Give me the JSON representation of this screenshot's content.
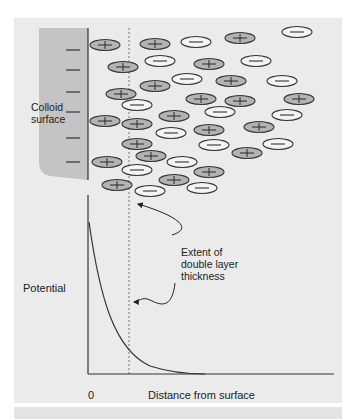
{
  "figure": {
    "colloid_label_line1": "Colloid",
    "colloid_label_line2": "surface",
    "annotation_line1": "Extent of",
    "annotation_line2": "double layer",
    "annotation_line3": "thickness",
    "y_axis_label": "Potential",
    "x_axis_origin": "0",
    "x_axis_label": "Distance from surface"
  },
  "colors": {
    "panel_bg": "#ebebeb",
    "colloid_fill": "#c4c4c4",
    "positive_ion_fill": "#b3b3b3",
    "negative_ion_fill": "#f4f4f4",
    "stroke": "#333333"
  },
  "ions": [
    {
      "x": 105,
      "y": 45,
      "sign": "+"
    },
    {
      "x": 155,
      "y": 44,
      "sign": "+"
    },
    {
      "x": 196,
      "y": 42,
      "sign": "-"
    },
    {
      "x": 240,
      "y": 38,
      "sign": "+"
    },
    {
      "x": 297,
      "y": 32,
      "sign": "-"
    },
    {
      "x": 123,
      "y": 67,
      "sign": "+"
    },
    {
      "x": 160,
      "y": 61,
      "sign": "-"
    },
    {
      "x": 209,
      "y": 64,
      "sign": "+"
    },
    {
      "x": 256,
      "y": 61,
      "sign": "-"
    },
    {
      "x": 155,
      "y": 86,
      "sign": "+"
    },
    {
      "x": 187,
      "y": 79,
      "sign": "-"
    },
    {
      "x": 231,
      "y": 81,
      "sign": "+"
    },
    {
      "x": 282,
      "y": 81,
      "sign": "-"
    },
    {
      "x": 121,
      "y": 94,
      "sign": "+"
    },
    {
      "x": 137,
      "y": 105,
      "sign": "-"
    },
    {
      "x": 201,
      "y": 99,
      "sign": "+"
    },
    {
      "x": 240,
      "y": 101,
      "sign": "+"
    },
    {
      "x": 299,
      "y": 99,
      "sign": "+"
    },
    {
      "x": 105,
      "y": 121,
      "sign": "+"
    },
    {
      "x": 137,
      "y": 124,
      "sign": "+"
    },
    {
      "x": 174,
      "y": 116,
      "sign": "+"
    },
    {
      "x": 220,
      "y": 112,
      "sign": "-"
    },
    {
      "x": 287,
      "y": 115,
      "sign": "-"
    },
    {
      "x": 171,
      "y": 133,
      "sign": "-"
    },
    {
      "x": 209,
      "y": 130,
      "sign": "+"
    },
    {
      "x": 259,
      "y": 127,
      "sign": "+"
    },
    {
      "x": 137,
      "y": 144,
      "sign": "+"
    },
    {
      "x": 214,
      "y": 145,
      "sign": "-"
    },
    {
      "x": 278,
      "y": 144,
      "sign": "-"
    },
    {
      "x": 107,
      "y": 162,
      "sign": "+"
    },
    {
      "x": 151,
      "y": 156,
      "sign": "+"
    },
    {
      "x": 182,
      "y": 162,
      "sign": "-"
    },
    {
      "x": 247,
      "y": 153,
      "sign": "+"
    },
    {
      "x": 137,
      "y": 170,
      "sign": "-"
    },
    {
      "x": 174,
      "y": 180,
      "sign": "+"
    },
    {
      "x": 209,
      "y": 172,
      "sign": "+"
    },
    {
      "x": 117,
      "y": 185,
      "sign": "+"
    },
    {
      "x": 150,
      "y": 191,
      "sign": "-"
    },
    {
      "x": 202,
      "y": 188,
      "sign": "-"
    }
  ]
}
